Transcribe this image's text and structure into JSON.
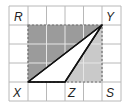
{
  "diagram": {
    "type": "geometry-grid",
    "grid": {
      "cols": 6,
      "rows": 5,
      "x0": 9,
      "y0": 6,
      "cell_w": 18.67,
      "cell_h": 19
    },
    "colors": {
      "grid_line": "#b8b8b8",
      "dark_shade": "#9b9b9b",
      "light_shade": "#c9c9c9",
      "triangle_fill": "#ffffff",
      "edge": "#111111",
      "dashed_border": "#777777"
    },
    "points": {
      "R": {
        "label": "R",
        "x": 28,
        "y": 25
      },
      "Y": {
        "label": "Y",
        "x": 102,
        "y": 25
      },
      "X": {
        "label": "X",
        "x": 28,
        "y": 82
      },
      "Z": {
        "label": "Z",
        "x": 65,
        "y": 82
      },
      "S": {
        "label": "S",
        "x": 102,
        "y": 82
      }
    },
    "labels": {
      "R": "R",
      "Y": "Y",
      "X": "X",
      "Z": "Z",
      "S": "S"
    }
  }
}
